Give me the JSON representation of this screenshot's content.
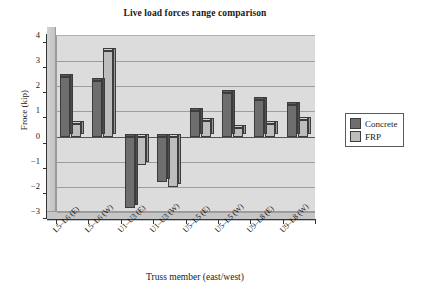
{
  "chart_data": {
    "type": "bar",
    "title": "Live load forces range comparison",
    "xlabel": "Truss member (east/west)",
    "ylabel": "Froce (kip)",
    "categories": [
      "L5–L6 (E)",
      "L5–L6 (W)",
      "U1–U3 (E)",
      "U1–U3 (W)",
      "U5–L5 (E)",
      "U5–L5 (W)",
      "U9–L8 (E)",
      "U9–L8 (W)"
    ],
    "series": [
      {
        "name": "Concrete",
        "color": "#6e6e6e",
        "values": [
          2.35,
          2.2,
          -2.85,
          -1.8,
          1.0,
          1.75,
          1.45,
          1.25
        ]
      },
      {
        "name": "FRP",
        "color": "#bdbdbd",
        "values": [
          0.5,
          3.4,
          -1.15,
          -2.0,
          0.6,
          0.35,
          0.5,
          0.65
        ]
      }
    ],
    "ylim": [
      -3,
      4
    ],
    "yticks": [
      4,
      3,
      2,
      1,
      0,
      -1,
      -2,
      -3
    ],
    "ytick_labels": [
      "4",
      "3",
      "2",
      "1",
      "0",
      "−1",
      "−2",
      "−3"
    ],
    "grid": true,
    "legend_position": "right",
    "style": "3d-column"
  }
}
